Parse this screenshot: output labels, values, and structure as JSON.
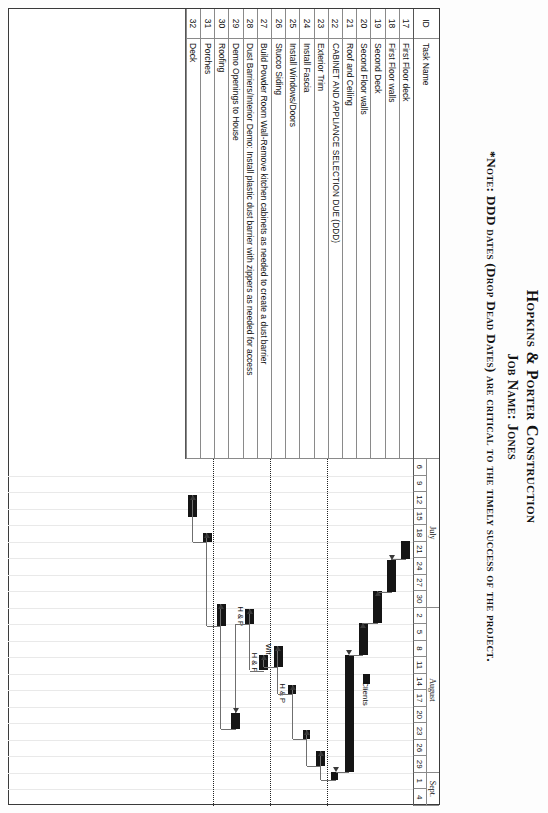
{
  "document": {
    "company": "Hopkins & Porter Construction",
    "job_line": "Job Name: Jones",
    "note": "*Note: DDD dates (Drop Dead Dates) are critical to the timely success of the project."
  },
  "table": {
    "headers": {
      "id": "ID",
      "task_name": "Task Name"
    },
    "rows": [
      {
        "id": "17",
        "name": "First Floor deck"
      },
      {
        "id": "18",
        "name": "First Floor walls"
      },
      {
        "id": "19",
        "name": "Second Deck"
      },
      {
        "id": "20",
        "name": "Second Floor walls"
      },
      {
        "id": "21",
        "name": "Roof and Ceiling"
      },
      {
        "id": "22",
        "name": "CABINET AND APPLIANCE SELECTION DUE (DDD)"
      },
      {
        "id": "23",
        "name": "Exterior Trim"
      },
      {
        "id": "24",
        "name": "Install Fascia"
      },
      {
        "id": "25",
        "name": "Install Windows/Doors"
      },
      {
        "id": "26",
        "name": "Stucco Siding"
      },
      {
        "id": "27",
        "name": "Build Powder Room Wall-Remove kitchen cabinets as needed to create a dust barrier"
      },
      {
        "id": "28",
        "name": "Dust Barriers/Interior Demo: Install plastic dust barrier with zippers as needed for access"
      },
      {
        "id": "29",
        "name": "Demo Openings to House"
      },
      {
        "id": "30",
        "name": "Roofing"
      },
      {
        "id": "31",
        "name": "Porches"
      },
      {
        "id": "32",
        "name": "Deck"
      }
    ]
  },
  "timescale": {
    "months": [
      {
        "label": "July",
        "start_index": 0,
        "span": 9
      },
      {
        "label": "August",
        "start_index": 9,
        "span": 10
      },
      {
        "label": "Sept.",
        "start_index": 19,
        "span": 2
      }
    ],
    "days": [
      "6",
      "9",
      "12",
      "15",
      "18",
      "21",
      "24",
      "27",
      "30",
      "2",
      "5",
      "8",
      "11",
      "14",
      "17",
      "20",
      "23",
      "26",
      "29",
      "1",
      "4"
    ]
  },
  "legend": {
    "swatch_label": "Clients"
  },
  "chart_data": {
    "type": "bar",
    "xlabel": "",
    "ylabel": "",
    "grid": true,
    "legend": "Clients",
    "categories": [
      "First Floor deck",
      "First Floor walls",
      "Second Deck",
      "Second Floor walls",
      "Roof and Ceiling",
      "CABINET AND APPLIANCE SELECTION DUE (DDD)",
      "Exterior Trim",
      "Install Fascia",
      "Install Windows/Doors",
      "Stucco Siding",
      "Build Powder Room Wall-Remove kitchen cabinets as needed to create a dust barrier",
      "Dust Barriers/Interior Demo: Install plastic dust barrier with zippers as needed for access",
      "Demo Openings to House",
      "Roofing",
      "Porches",
      "Deck"
    ],
    "bars": [
      {
        "row": 0,
        "id": "17",
        "start_day": "21",
        "end_day": "24",
        "start_x": 4.95,
        "width": 1.1,
        "milestone": false,
        "label": ""
      },
      {
        "row": 1,
        "id": "18",
        "start_day": "24",
        "end_day": "28",
        "start_x": 6.1,
        "width": 1.95,
        "milestone": false,
        "label": ""
      },
      {
        "row": 2,
        "id": "19",
        "start_day": "29",
        "end_day": "2",
        "start_x": 8.0,
        "width": 1.95,
        "milestone": false,
        "label": ""
      },
      {
        "row": 3,
        "id": "20",
        "start_day": "3",
        "end_day": "8",
        "start_x": 9.9,
        "width": 1.95,
        "milestone": false,
        "label": ""
      },
      {
        "row": 4,
        "id": "21",
        "start_day": "8",
        "end_day": "27",
        "start_x": 11.85,
        "width": 7.1,
        "milestone": false,
        "label": ""
      },
      {
        "row": 5,
        "id": "22",
        "start_day": "27",
        "end_day": "28",
        "start_x": 18.95,
        "width": 0.5,
        "milestone": true,
        "label": ""
      },
      {
        "row": 6,
        "id": "23",
        "start_day": "28",
        "end_day": "30",
        "start_x": 17.65,
        "width": 0.95,
        "milestone": false,
        "label": ""
      },
      {
        "row": 7,
        "id": "24",
        "start_day": "30",
        "end_day": "31",
        "start_x": 16.4,
        "width": 0.55,
        "milestone": true,
        "label": ""
      },
      {
        "row": 8,
        "id": "25",
        "start_day": "31",
        "end_day": "2",
        "start_x": 13.7,
        "width": 0.55,
        "milestone": true,
        "label": "H & P"
      },
      {
        "row": 9,
        "id": "26",
        "start_day": "2",
        "end_day": "5",
        "start_x": 11.3,
        "width": 1.3,
        "milestone": false,
        "label": "Wit."
      },
      {
        "row": 10,
        "id": "27",
        "start_day": "5",
        "end_day": "7",
        "start_x": 11.85,
        "width": 0.95,
        "milestone": false,
        "label": "H & P"
      },
      {
        "row": 11,
        "id": "28",
        "start_day": "7",
        "end_day": "9",
        "start_x": 9.05,
        "width": 0.95,
        "milestone": false,
        "label": "H & P"
      },
      {
        "row": 12,
        "id": "29",
        "start_day": "9",
        "end_day": "11",
        "start_x": 15.35,
        "width": 1.0,
        "milestone": false,
        "label": ""
      },
      {
        "row": 13,
        "id": "30",
        "start_day": "11",
        "end_day": "13",
        "start_x": 8.8,
        "width": 1.3,
        "milestone": false,
        "label": ""
      },
      {
        "row": 14,
        "id": "31",
        "start_day": "13",
        "end_day": "16",
        "start_x": 4.5,
        "width": 0.55,
        "milestone": false,
        "label": ""
      },
      {
        "row": 15,
        "id": "32",
        "start_day": "16",
        "end_day": "18",
        "start_x": 2.2,
        "width": 1.3,
        "milestone": false,
        "label": ""
      }
    ],
    "ddd_lines": [
      {
        "after_row": 5,
        "label": "DDD line 1"
      },
      {
        "after_row": 9,
        "label": "DDD line 2"
      },
      {
        "after_row": 13,
        "label": "DDD line 3"
      }
    ]
  }
}
